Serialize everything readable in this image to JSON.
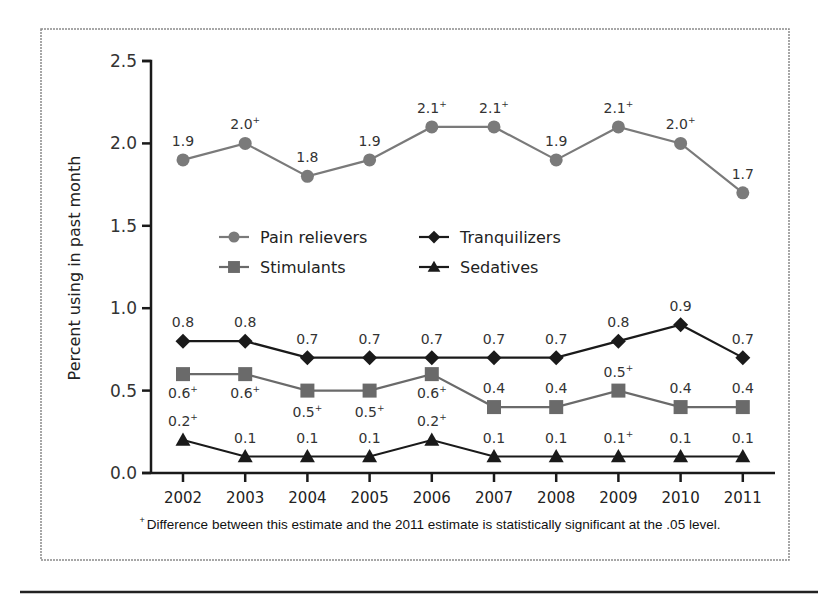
{
  "chart_data": {
    "type": "line",
    "title": "",
    "xlabel": "",
    "ylabel": "Percent using in past month",
    "ylim": [
      0.0,
      2.5
    ],
    "yticks": [
      "0.0",
      "0.5",
      "1.0",
      "1.5",
      "2.0",
      "2.5"
    ],
    "grid": false,
    "legend_position": "inside, center-left (two columns)",
    "categories": [
      "2002",
      "2003",
      "2004",
      "2005",
      "2006",
      "2007",
      "2008",
      "2009",
      "2010",
      "2011"
    ],
    "series": [
      {
        "name": "Pain relievers",
        "marker": "circle",
        "color": "#7a7a7a",
        "values": [
          1.9,
          2.0,
          1.8,
          1.9,
          2.1,
          2.1,
          1.9,
          2.1,
          2.0,
          1.7
        ],
        "labels": [
          "1.9",
          "2.0",
          "1.8",
          "1.9",
          "2.1",
          "2.1",
          "1.9",
          "2.1",
          "2.0",
          "1.7"
        ],
        "significant": [
          false,
          true,
          false,
          false,
          true,
          true,
          false,
          true,
          true,
          false
        ]
      },
      {
        "name": "Tranquilizers",
        "marker": "diamond",
        "color": "#1a1a1a",
        "values": [
          0.8,
          0.8,
          0.7,
          0.7,
          0.7,
          0.7,
          0.7,
          0.8,
          0.9,
          0.7
        ],
        "labels": [
          "0.8",
          "0.8",
          "0.7",
          "0.7",
          "0.7",
          "0.7",
          "0.7",
          "0.8",
          "0.9",
          "0.7"
        ],
        "significant": [
          false,
          false,
          false,
          false,
          false,
          false,
          false,
          false,
          false,
          false
        ]
      },
      {
        "name": "Stimulants",
        "marker": "square",
        "color": "#6a6a6a",
        "values": [
          0.6,
          0.6,
          0.5,
          0.5,
          0.6,
          0.4,
          0.4,
          0.5,
          0.4,
          0.4
        ],
        "labels": [
          "0.6",
          "0.6",
          "0.5",
          "0.5",
          "0.6",
          "0.4",
          "0.4",
          "0.5",
          "0.4",
          "0.4"
        ],
        "significant": [
          true,
          true,
          true,
          true,
          true,
          false,
          false,
          true,
          false,
          false
        ]
      },
      {
        "name": "Sedatives",
        "marker": "triangle",
        "color": "#1a1a1a",
        "values": [
          0.2,
          0.1,
          0.1,
          0.1,
          0.2,
          0.1,
          0.1,
          0.1,
          0.1,
          0.1
        ],
        "labels": [
          "0.2",
          "0.1",
          "0.1",
          "0.1",
          "0.2",
          "0.1",
          "0.1",
          "0.1",
          "0.1",
          "0.1"
        ],
        "significant": [
          true,
          false,
          false,
          false,
          true,
          false,
          false,
          true,
          false,
          false
        ]
      }
    ],
    "annotations": {
      "significance_marker": "+",
      "footnote": "Difference between this estimate and the 2011 estimate is statistically significant at the .05 level."
    }
  },
  "legend": {
    "items": [
      {
        "label": "Pain relievers",
        "marker": "circle"
      },
      {
        "label": "Tranquilizers",
        "marker": "diamond"
      },
      {
        "label": "Stimulants",
        "marker": "square"
      },
      {
        "label": "Sedatives",
        "marker": "triangle"
      }
    ]
  },
  "footnote": {
    "symbol": "+",
    "text": "Difference between this estimate and the 2011 estimate is statistically significant at the .05 level."
  },
  "colors": {
    "pain_relievers": "#7a7a7a",
    "stimulants": "#6a6a6a",
    "dark": "#1a1a1a",
    "frame": "#8a8a8a"
  }
}
